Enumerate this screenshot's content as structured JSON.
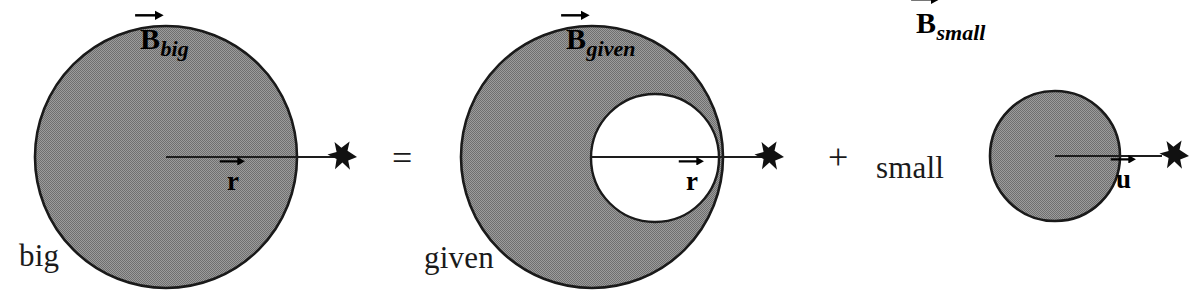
{
  "diagram": {
    "type": "physics-superposition-diagram",
    "fill_color": "#8a8a8a",
    "outline_color": "#1a1a1a",
    "background_color": "#ffffff",
    "equation_reading": "B_big = B_given + B_small"
  },
  "panels": [
    {
      "id": "big",
      "word_label": "big",
      "field_label": {
        "base": "B",
        "subscript": "big"
      },
      "radius_label": {
        "base": "r",
        "subscript": ""
      },
      "shape": "filled-circle",
      "circle": {
        "cx": 166,
        "cy": 157,
        "r": 131
      },
      "arrow": {
        "x1": 166,
        "y1": 157,
        "x2": 352,
        "y2": 157,
        "head": "star"
      }
    },
    {
      "id": "given",
      "word_label": "given",
      "field_label": {
        "base": "B",
        "subscript": "given"
      },
      "radius_label": {
        "base": "r",
        "subscript": ""
      },
      "shape": "annulus-offset-hole",
      "outer_circle": {
        "cx": 592,
        "cy": 157,
        "r": 131
      },
      "inner_circle": {
        "cx": 655,
        "cy": 158,
        "r": 64
      },
      "arrow": {
        "x1": 592,
        "y1": 157,
        "x2": 779,
        "y2": 157,
        "head": "star"
      }
    },
    {
      "id": "small",
      "word_label": "small",
      "field_label": {
        "base": "B",
        "subscript": "small"
      },
      "radius_label": {
        "base": "u",
        "subscript": ""
      },
      "shape": "filled-circle",
      "circle": {
        "cx": 1055,
        "cy": 156,
        "r": 65
      },
      "arrow": {
        "x1": 1055,
        "y1": 156,
        "x2": 1176,
        "y2": 156,
        "head": "star"
      }
    }
  ],
  "operators": {
    "equals": "=",
    "plus": "+"
  },
  "icons": {
    "star_marker": "star-field-point-icon",
    "vector_arrow": "vector-arrow-icon"
  }
}
